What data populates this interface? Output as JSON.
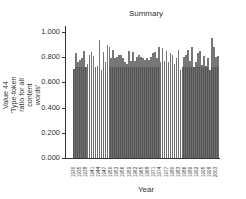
{
  "chart_data": {
    "type": "bar",
    "title": "Summary",
    "xlabel": "Year",
    "ylabel": "Value 44 'Type-token ratio for all content words'",
    "ylim": [
      0,
      1.0
    ],
    "yticks": [
      "0.000",
      "0.200",
      "0.400",
      "0.600",
      "0.800",
      "1.000"
    ],
    "xticklabels": [
      "1930",
      "1935",
      "1938",
      "1941",
      "1944",
      "1947",
      "1950",
      "1953",
      "1956",
      "1959",
      "1962",
      "1965",
      "1968",
      "1971",
      "1974",
      "1977",
      "1980",
      "1983",
      "1986",
      "1989",
      "1992",
      "1995",
      "1998",
      "2003"
    ],
    "grid": false,
    "legend": null,
    "colors": {
      "bar": "#555555",
      "bar_edge": "#8a8a8a",
      "axis": "#333333"
    },
    "categories": [
      1930,
      1931,
      1932,
      1933,
      1934,
      1935,
      1936,
      1937,
      1938,
      1939,
      1940,
      1941,
      1942,
      1943,
      1944,
      1945,
      1946,
      1947,
      1948,
      1949,
      1950,
      1951,
      1952,
      1953,
      1954,
      1955,
      1956,
      1957,
      1958,
      1959,
      1960,
      1961,
      1962,
      1963,
      1964,
      1965,
      1966,
      1967,
      1968,
      1969,
      1970,
      1971,
      1972,
      1973,
      1974,
      1975,
      1976,
      1977,
      1978,
      1979,
      1980,
      1981,
      1982,
      1983,
      1984,
      1985,
      1986,
      1987,
      1988,
      1989,
      1990,
      1991,
      1992,
      1993,
      1994,
      1995,
      1996,
      1997,
      1998,
      1999,
      2000,
      2001,
      2002,
      2003
    ],
    "values": [
      0.71,
      0.83,
      0.76,
      0.78,
      0.79,
      0.85,
      0.72,
      0.75,
      0.82,
      0.84,
      0.81,
      0.72,
      0.73,
      0.94,
      0.7,
      0.84,
      0.76,
      0.9,
      0.88,
      0.79,
      0.86,
      0.79,
      0.8,
      0.82,
      0.82,
      0.79,
      0.76,
      0.75,
      0.85,
      0.77,
      0.84,
      0.77,
      0.8,
      0.82,
      0.8,
      0.79,
      0.78,
      0.79,
      0.78,
      0.8,
      0.83,
      0.84,
      0.79,
      0.88,
      0.76,
      0.87,
      0.77,
      0.85,
      0.76,
      0.83,
      0.82,
      0.75,
      0.79,
      0.86,
      0.7,
      0.72,
      0.8,
      0.82,
      0.86,
      0.77,
      0.88,
      0.72,
      0.76,
      0.83,
      0.85,
      0.74,
      0.81,
      0.73,
      0.79,
      0.7,
      0.95,
      0.88,
      0.8,
      0.81
    ]
  }
}
